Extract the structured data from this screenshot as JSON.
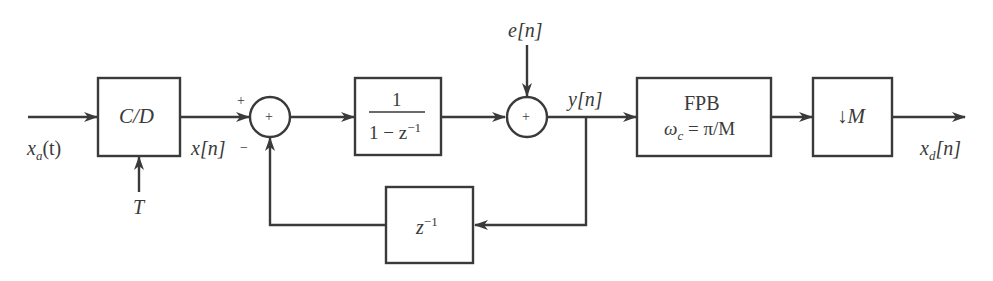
{
  "diagram": {
    "type": "block-diagram",
    "stroke_color": "#3a3a3a",
    "inputs": {
      "analog_input": "x_a(t)",
      "sampling_period": "T",
      "noise_input": "e[n]"
    },
    "blocks": {
      "cd_converter": "C/D",
      "accumulator_num": "1",
      "accumulator_den_pre": "1 − z",
      "accumulator_den_exp": "−1",
      "delay_base": "z",
      "delay_exp": "−1",
      "lowpass_title": "FPB",
      "lowpass_cutoff_omega": "ω",
      "lowpass_cutoff_sub": "c",
      "lowpass_cutoff_rhs": " = π/M",
      "downsampler_arrow": "↓",
      "downsampler_factor": "M"
    },
    "signals": {
      "sampled": "x[n]",
      "output": "y[n]",
      "decimated_base": "x",
      "decimated_sub": "d",
      "decimated_arg": "[n]",
      "analog_base": "x",
      "analog_sub": "a",
      "analog_arg": "(t)"
    },
    "summers": {
      "summer1_symbol": "+",
      "summer1_plus_sign": "+",
      "summer1_minus_sign": "−",
      "summer2_symbol": "+"
    }
  }
}
